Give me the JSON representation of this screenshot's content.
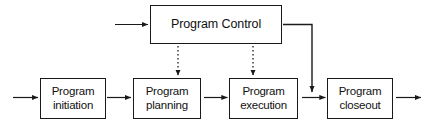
{
  "diagram": {
    "background_color": "#ffffff",
    "stroke_color": "#1a1a1a",
    "text_color": "#111111",
    "nodes": [
      {
        "id": "program-control",
        "label": "Program Control",
        "shape": "rectangle",
        "row": "top"
      },
      {
        "id": "program-initiation",
        "label": "Program\ninitiation",
        "shape": "rectangle",
        "row": "main"
      },
      {
        "id": "program-planning",
        "label": "Program\nplanning",
        "shape": "rectangle",
        "row": "main"
      },
      {
        "id": "program-execution",
        "label": "Program\nexecution",
        "shape": "rectangle",
        "row": "main"
      },
      {
        "id": "program-closeout",
        "label": "Program\ncloseout",
        "shape": "rectangle",
        "row": "main"
      }
    ],
    "connectors": [
      {
        "id": "input-to-initiation",
        "from": "external-input",
        "to": "program-initiation",
        "style": "solid",
        "arrow": "end"
      },
      {
        "id": "initiation-to-planning",
        "from": "program-initiation",
        "to": "program-planning",
        "style": "solid",
        "arrow": "end"
      },
      {
        "id": "planning-to-execution",
        "from": "program-planning",
        "to": "program-execution",
        "style": "solid",
        "arrow": "end"
      },
      {
        "id": "execution-to-closeout",
        "from": "program-execution",
        "to": "program-closeout",
        "style": "solid",
        "arrow": "end"
      },
      {
        "id": "closeout-to-output",
        "from": "program-closeout",
        "to": "external-output",
        "style": "solid",
        "arrow": "end"
      },
      {
        "id": "input-to-control",
        "from": "external-input",
        "to": "program-control",
        "style": "solid",
        "arrow": "end"
      },
      {
        "id": "control-to-planning",
        "from": "program-control",
        "to": "program-planning",
        "style": "dotted",
        "arrow": "end"
      },
      {
        "id": "control-to-execution",
        "from": "program-control",
        "to": "program-execution",
        "style": "dotted",
        "arrow": "end"
      },
      {
        "id": "control-to-closeout-junction",
        "from": "program-control",
        "to": "execution-closeout-link",
        "style": "solid",
        "arrow": "end"
      }
    ]
  }
}
